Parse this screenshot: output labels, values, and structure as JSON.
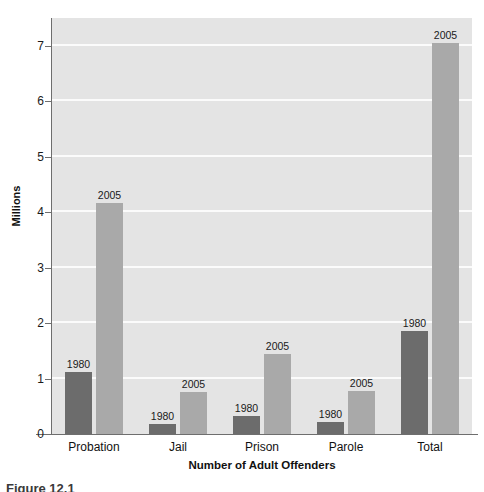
{
  "chart_data": {
    "type": "bar",
    "title": "",
    "xlabel": "Number of Adult Offenders",
    "ylabel": "Millions",
    "ylim": [
      0,
      7.5
    ],
    "yticks": [
      "0",
      "1",
      "2",
      "3",
      "4",
      "5",
      "6",
      "7"
    ],
    "ytick_values": [
      0,
      1,
      2,
      3,
      4,
      5,
      6,
      7
    ],
    "grid": "horizontal",
    "legend": "none",
    "categories": [
      "Probation",
      "Jail",
      "Prison",
      "Parole",
      "Total"
    ],
    "series": [
      {
        "name": "1980",
        "color": "#6c6c6c",
        "values": [
          1.12,
          0.18,
          0.32,
          0.22,
          1.85
        ],
        "point_labels": [
          "1980",
          "1980",
          "1980",
          "1980",
          "1980"
        ]
      },
      {
        "name": "2005",
        "color": "#a9a9a9",
        "values": [
          4.16,
          0.75,
          1.45,
          0.78,
          7.05
        ],
        "point_labels": [
          "2005",
          "2005",
          "2005",
          "2005",
          "2005"
        ]
      }
    ],
    "plot_background": "#e4e4e4",
    "gridline_color": "#fbfbfb",
    "axis_color": "#6e6e6e"
  },
  "caption": {
    "text": "Figure 12.1"
  }
}
